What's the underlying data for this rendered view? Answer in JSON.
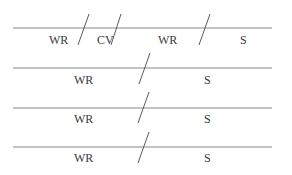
{
  "diagram": {
    "colors": {
      "line": "#8a8a8a",
      "slash": "#5a5a5a",
      "text": "#3a3a3a",
      "background": "#ffffff"
    },
    "rows": [
      {
        "line": {
          "x1": 13,
          "x2": 272,
          "y": 28
        },
        "slashes": [
          {
            "x1": 89,
            "y1": 14,
            "x2": 78,
            "y2": 45
          },
          {
            "x1": 121,
            "y1": 14,
            "x2": 111,
            "y2": 45
          },
          {
            "x1": 210,
            "y1": 14,
            "x2": 199,
            "y2": 45
          }
        ],
        "labels": [
          {
            "text": "WR",
            "x": 49,
            "y": 44
          },
          {
            "text": "CV",
            "x": 97,
            "y": 44
          },
          {
            "text": "WR",
            "x": 158,
            "y": 44
          },
          {
            "text": "S",
            "x": 240,
            "y": 44
          }
        ]
      },
      {
        "line": {
          "x1": 13,
          "x2": 272,
          "y": 68
        },
        "slashes": [
          {
            "x1": 150,
            "y1": 53,
            "x2": 139,
            "y2": 84
          }
        ],
        "labels": [
          {
            "text": "WR",
            "x": 74,
            "y": 84
          },
          {
            "text": "S",
            "x": 204,
            "y": 84
          }
        ]
      },
      {
        "line": {
          "x1": 13,
          "x2": 272,
          "y": 108
        },
        "slashes": [
          {
            "x1": 149,
            "y1": 92,
            "x2": 138,
            "y2": 123
          }
        ],
        "labels": [
          {
            "text": "WR",
            "x": 74,
            "y": 123
          },
          {
            "text": "S",
            "x": 204,
            "y": 123
          }
        ]
      },
      {
        "line": {
          "x1": 13,
          "x2": 272,
          "y": 147
        },
        "slashes": [
          {
            "x1": 149,
            "y1": 132,
            "x2": 138,
            "y2": 163
          }
        ],
        "labels": [
          {
            "text": "WR",
            "x": 74,
            "y": 162
          },
          {
            "text": "S",
            "x": 204,
            "y": 162
          }
        ]
      }
    ]
  }
}
